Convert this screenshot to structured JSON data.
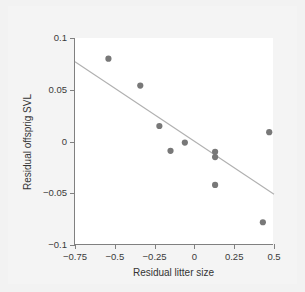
{
  "chart_data": {
    "type": "scatter",
    "title": "",
    "xlabel": "Residual litter size",
    "ylabel": "Residual offsprig SVL",
    "xlim": [
      -0.75,
      0.5
    ],
    "ylim": [
      -0.1,
      0.1
    ],
    "xticks": [
      -0.75,
      -0.5,
      -0.25,
      0,
      0.25,
      0.5
    ],
    "xtick_labels": [
      "−0.75",
      "−0.5",
      "−0.25",
      "0",
      "0.25",
      "0.5"
    ],
    "yticks": [
      -0.1,
      -0.05,
      0,
      0.05,
      0.1
    ],
    "ytick_labels": [
      "−0.1",
      "−0.05",
      "0",
      "0.05",
      "0.1"
    ],
    "grid": false,
    "legend": null,
    "marker_color": "#787878",
    "line_color": "#b0b0b0",
    "points": [
      {
        "x": -0.54,
        "y": 0.08
      },
      {
        "x": -0.34,
        "y": 0.054
      },
      {
        "x": -0.22,
        "y": 0.015
      },
      {
        "x": -0.15,
        "y": -0.009
      },
      {
        "x": -0.06,
        "y": -0.001
      },
      {
        "x": 0.13,
        "y": -0.01
      },
      {
        "x": 0.13,
        "y": -0.015
      },
      {
        "x": 0.13,
        "y": -0.042
      },
      {
        "x": 0.43,
        "y": -0.078
      },
      {
        "x": 0.47,
        "y": 0.009
      }
    ],
    "fit_line": {
      "x_start": -0.75,
      "y_start": 0.077,
      "x_end": 0.5,
      "y_end": -0.051
    }
  }
}
